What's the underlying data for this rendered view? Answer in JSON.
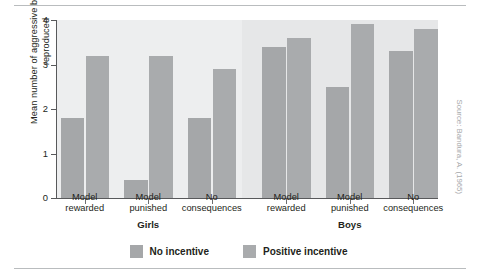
{
  "figure": {
    "source_credit": "Source: Bandura, A. (1965)"
  },
  "legend": {
    "items": [
      {
        "label": "No incentive",
        "color": "#a5a7a9",
        "swatch_icon": "legend-swatch-icon"
      },
      {
        "label": "Positive incentive",
        "color": "#a9abad",
        "swatch_icon": "legend-swatch-icon"
      }
    ]
  },
  "axis": {
    "y_title": "Mean number of aggressive behaviours reproduced",
    "y_ticks": [
      "0",
      "1",
      "2",
      "3",
      "4"
    ]
  },
  "groups": [
    {
      "name": "Girls"
    },
    {
      "name": "Boys"
    }
  ],
  "categories": [
    {
      "line1": "Model",
      "line2": "rewarded"
    },
    {
      "line1": "Model",
      "line2": "punished"
    },
    {
      "line1": "No",
      "line2": "consequences"
    },
    {
      "line1": "Model",
      "line2": "rewarded"
    },
    {
      "line1": "Model",
      "line2": "punished"
    },
    {
      "line1": "No",
      "line2": "consequences"
    }
  ],
  "chart_data": {
    "type": "bar",
    "title": "",
    "xlabel": "",
    "ylabel": "Mean number of aggressive behaviours reproduced",
    "ylim": [
      0,
      4
    ],
    "yticks": [
      0,
      1,
      2,
      3,
      4
    ],
    "grid": false,
    "legend_position": "bottom-center",
    "groups": [
      "Girls",
      "Girls",
      "Girls",
      "Boys",
      "Boys",
      "Boys"
    ],
    "categories": [
      "Model rewarded",
      "Model punished",
      "No consequences",
      "Model rewarded",
      "Model punished",
      "No consequences"
    ],
    "series": [
      {
        "name": "No incentive",
        "color": "#a5a7a9",
        "values": [
          1.8,
          0.4,
          1.8,
          3.4,
          2.5,
          3.3
        ]
      },
      {
        "name": "Positive incentive",
        "color": "#a9abad",
        "values": [
          3.2,
          3.2,
          2.9,
          3.6,
          3.9,
          3.8
        ]
      }
    ],
    "annotations": [
      "Source: Bandura, A. (1965)"
    ]
  }
}
